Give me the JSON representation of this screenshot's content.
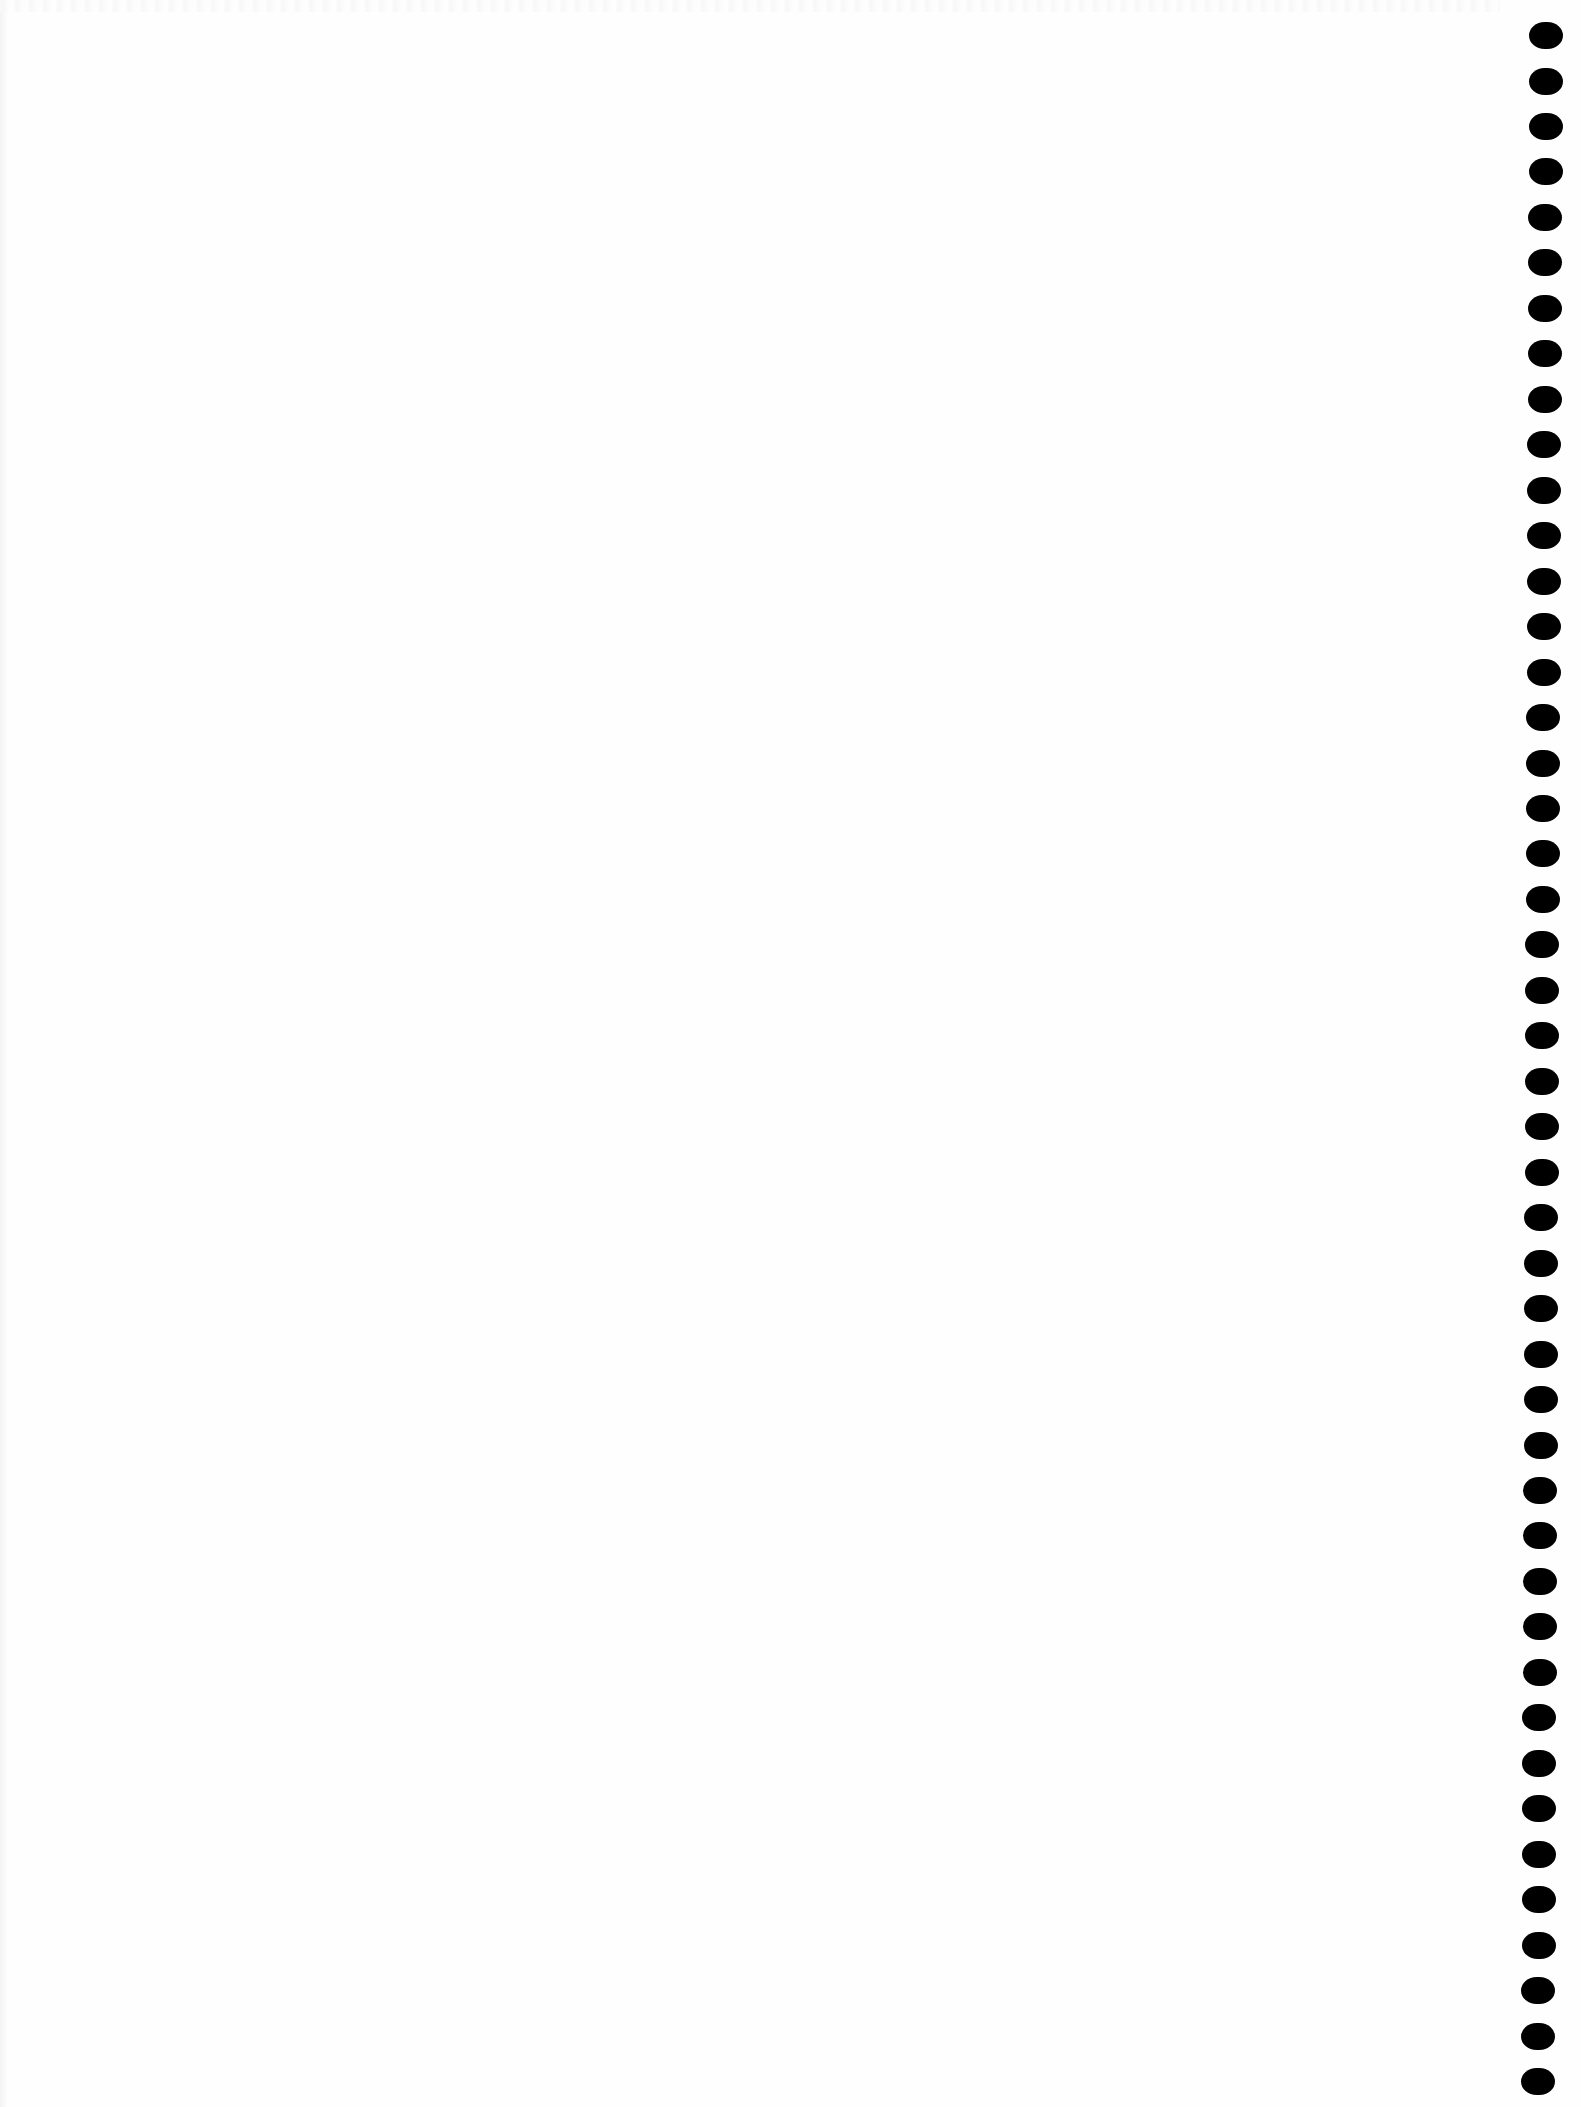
{
  "document": {
    "type": "blank-notebook-page",
    "binding_edge": "right",
    "hole_count": 46,
    "hole_color": "#000000",
    "paper_color": "#fefefe",
    "text": ""
  }
}
